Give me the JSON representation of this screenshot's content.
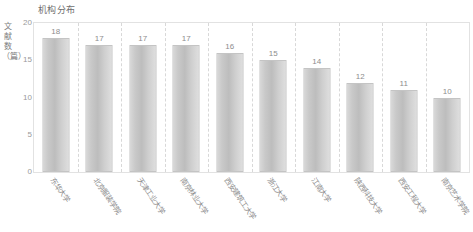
{
  "chart_data": {
    "type": "bar",
    "title": "机构分布",
    "xlabel": "",
    "ylabel": "文献数（篇）",
    "ylim": [
      0,
      20
    ],
    "yticks": [
      20,
      15,
      10,
      5,
      0
    ],
    "grid": "vertical-dashed-separators",
    "legend": null,
    "categories": [
      "东华大学",
      "北京服装学院",
      "天津工业大学",
      "南京林业大学",
      "西安建筑工大学",
      "浙江大学",
      "江南大学",
      "陕西科技大学",
      "西安工程大学",
      "南京艺术学院"
    ],
    "values": [
      18,
      17,
      17,
      17,
      16,
      15,
      14,
      12,
      11,
      10
    ],
    "data_labels": [
      "18",
      "17",
      "17",
      "17",
      "16",
      "15",
      "14",
      "12",
      "11",
      "10"
    ]
  },
  "colors": {
    "bar_fill": "#c9c9c9",
    "bar_border": "#c4c4c4",
    "frame": "#e2e2e2",
    "gridline": "#d8d8d8",
    "text": "#8d8d8d",
    "background": "#ffffff"
  }
}
